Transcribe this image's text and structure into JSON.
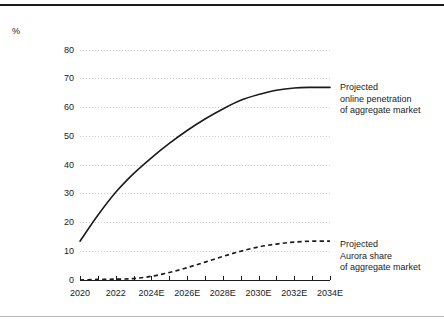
{
  "figure": {
    "unit_label": "%",
    "background_color": "#ffffff",
    "top_rule_color": "#1b1b1b",
    "bottom_rule_color": "#b9b9b9",
    "text_color": "#1b1b1b",
    "gridline_color": "#cfcfcf",
    "axis_color": "#1b1b1b"
  },
  "legends": [
    {
      "id": "online-penetration",
      "style": "solid",
      "lines": [
        "Projected",
        "online penetration",
        "of aggregate market"
      ]
    },
    {
      "id": "aurora-share",
      "style": "dashed",
      "lines": [
        "Projected",
        "Aurora share",
        "of aggregate market"
      ]
    }
  ],
  "chart_data": {
    "type": "line",
    "title": "",
    "subtitle": "",
    "xlabel": "",
    "ylabel": "%",
    "xlim": [
      2020,
      2034
    ],
    "ylim": [
      0,
      80
    ],
    "yticks": [
      0,
      10,
      20,
      30,
      40,
      50,
      60,
      70,
      80
    ],
    "ytick_labels": [
      "0",
      "10",
      "20",
      "30",
      "40",
      "50",
      "60",
      "70",
      "80"
    ],
    "x": [
      2020,
      2021,
      2022,
      2023,
      2024,
      2025,
      2026,
      2027,
      2028,
      2029,
      2030,
      2031,
      2032,
      2033,
      2034
    ],
    "xticks": [
      2020,
      2021,
      2022,
      2023,
      2024,
      2025,
      2026,
      2027,
      2028,
      2029,
      2030,
      2031,
      2032,
      2033,
      2034
    ],
    "xtick_labels": [
      "2020",
      "2022",
      "2024E",
      "2026E",
      "2028E",
      "2030E",
      "2032E",
      "2034E"
    ],
    "xtick_label_values": [
      2020,
      2022,
      2024,
      2026,
      2028,
      2030,
      2032,
      2034
    ],
    "grid": true,
    "grid_axis": "y",
    "legend_position": "right-inline",
    "series": [
      {
        "name": "Projected online penetration of aggregate market",
        "style": "solid",
        "color": "#1b1b1b",
        "values": [
          13.5,
          22.5,
          30.5,
          37.0,
          42.5,
          47.5,
          52.0,
          56.0,
          59.5,
          62.5,
          64.5,
          66.0,
          66.8,
          67.0,
          67.0
        ]
      },
      {
        "name": "Projected Aurora share of aggregate market",
        "style": "dashed",
        "color": "#1b1b1b",
        "values": [
          0.0,
          0.2,
          0.3,
          0.5,
          1.3,
          2.6,
          4.3,
          6.2,
          8.2,
          10.0,
          11.5,
          12.5,
          13.2,
          13.5,
          13.5
        ]
      }
    ]
  }
}
